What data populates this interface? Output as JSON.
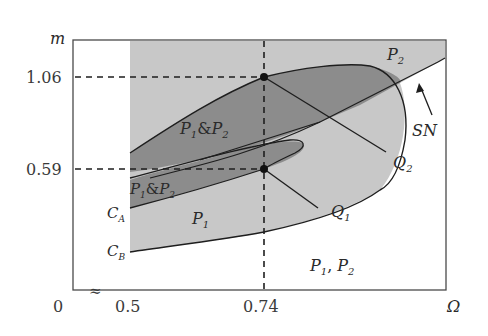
{
  "figure": {
    "axes": {
      "x_label": "Ω",
      "y_label": "m",
      "origin_label": "0",
      "axis_break_symbol": "≈",
      "x_ticks": [
        "0.5",
        "0.74"
      ],
      "y_ticks": [
        "1.06",
        "0.59"
      ]
    },
    "regions": {
      "p1_and_p2_upper": {
        "main": "P",
        "sub1": "1",
        "amp": "&",
        "main2": "P",
        "sub2": "2"
      },
      "p1_and_p2_lower": {
        "main": "P",
        "sub1": "1",
        "amp": "&",
        "main2": "P",
        "sub2": "2"
      },
      "p1": {
        "main": "P",
        "sub": "1"
      },
      "p2": {
        "main": "P",
        "sub": "2"
      },
      "p1_comma_p2": {
        "main": "P",
        "sub1": "1",
        "sep": ", ",
        "main2": "P",
        "sub2": "2"
      }
    },
    "curves": {
      "ca": {
        "main": "C",
        "sub": "A"
      },
      "cb": {
        "main": "C",
        "sub": "B"
      },
      "sn": "SN"
    },
    "points": {
      "q1": {
        "main": "Q",
        "sub": "1",
        "omega": 0.74,
        "m": 0.59
      },
      "q2": {
        "main": "Q",
        "sub": "2",
        "omega": 0.74,
        "m": 1.06
      }
    },
    "colors": {
      "light_region": "#c8c8c8",
      "dark_region": "#8c8c8c",
      "frame": "#4a4a4a",
      "curve": "#1e1e1e"
    }
  }
}
